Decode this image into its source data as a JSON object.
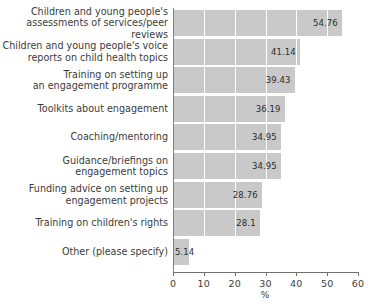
{
  "chart_data": {
    "type": "bar",
    "orientation": "horizontal",
    "title": "",
    "subtitle": "",
    "xlabel": "%",
    "ylabel": "",
    "xlim": [
      0,
      60
    ],
    "xticks": [
      0,
      10,
      20,
      30,
      40,
      50,
      60
    ],
    "xtick_labels": [
      "0",
      "10",
      "20",
      "30",
      "40",
      "50",
      "60"
    ],
    "grid": true,
    "grid_axis": "x",
    "legend": false,
    "bar_color": "#c9c9c9",
    "axis_color": "#707070",
    "text_color": "#3b3b3b",
    "categories": [
      "Children and young people's\nassessments of services/peer reviews",
      "Children and young people's voice\nreports on child health topics",
      "Training on setting up\nan engagement programme",
      "Toolkits about engagement",
      "Coaching/mentoring",
      "Guidance/briefings on\nengagement topics",
      "Funding advice on setting up\nengagement projects",
      "Training on children's rights",
      "Other (please specify)"
    ],
    "values": [
      54.76,
      41.14,
      39.43,
      36.19,
      34.95,
      34.95,
      28.76,
      28.1,
      5.14
    ],
    "value_labels": [
      "54.76",
      "41.14",
      "39.43",
      "36.19",
      "34.95",
      "34.95",
      "28.76",
      "28.1",
      "5.14"
    ]
  }
}
